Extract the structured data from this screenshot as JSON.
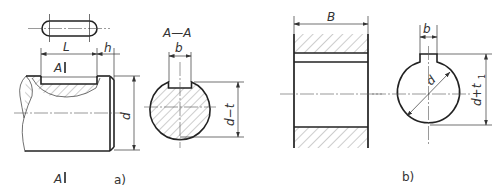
{
  "figure": {
    "type": "key-and-keyway-engineering-drawing",
    "panel_a": {
      "caption": "a)",
      "key_top_view": {
        "shape": "rounded-slot"
      },
      "shaft_side_view": {
        "dim_length": "L",
        "dim_offset": "h",
        "dim_diameter": "d",
        "section_mark_top": "A",
        "section_mark_bottom": "A"
      },
      "section_view": {
        "title": "A—A",
        "dim_key_width": "b",
        "dim_depth": "d−t"
      }
    },
    "panel_b": {
      "caption": "b)",
      "hub_side_view": {
        "dim_width": "B"
      },
      "hub_section": {
        "dim_key_width": "b",
        "dim_diameter": "d",
        "dim_depth_main": "d+t",
        "dim_depth_sub": "1"
      }
    }
  },
  "colors": {
    "line": "#222222",
    "hatch": "#555555",
    "background": "#ffffff"
  }
}
